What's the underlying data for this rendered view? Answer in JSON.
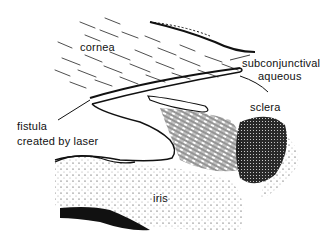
{
  "figure": {
    "type": "anatomical-illustration",
    "background_color": "#ffffff",
    "ink_color": "#111111"
  },
  "labels": {
    "cornea": "cornea",
    "subconjunctival_line1": "subconjunctival",
    "subconjunctival_line2": "aqueous",
    "sclera": "sclera",
    "fistula_line1": "fistula",
    "fistula_line2": "created by laser",
    "iris": "iris"
  }
}
